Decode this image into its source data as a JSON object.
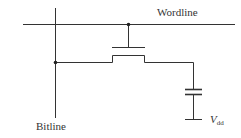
{
  "labels": {
    "wordline": "Wordline",
    "bitline": "Bitline",
    "vdd_main": "V",
    "vdd_sub": "dd"
  },
  "colors": {
    "line": "#333333",
    "background": "#ffffff"
  }
}
